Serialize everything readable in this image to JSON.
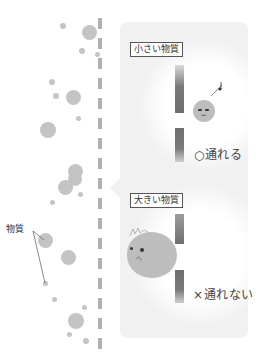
{
  "diagram": {
    "type": "membrane-permeability-illustration",
    "left_side": {
      "label": "物質",
      "membrane": "dashed-vertical-line"
    },
    "panel_top": {
      "title": "小さい物質",
      "result": "○通れる",
      "particle": "small-smiling-ball",
      "note": "♪"
    },
    "panel_bottom": {
      "title": "大きい物質",
      "result": "×通れない",
      "particle": "large-ball-stuck"
    },
    "colors": {
      "particle": "#c4c4c4",
      "membrane": "#b0b0b0",
      "wall": "#7a7a7a",
      "panel_bg": "#f1f1f1"
    }
  }
}
